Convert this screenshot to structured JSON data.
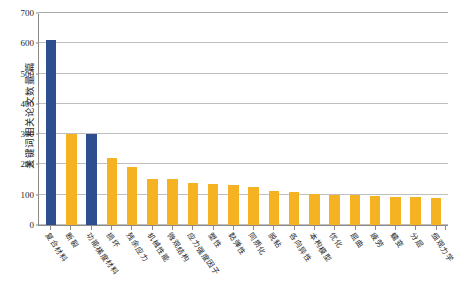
{
  "chart_data": {
    "type": "bar",
    "title": "",
    "xlabel": "",
    "ylabel": "关键词相关论文数量/篇",
    "ylim": [
      0,
      700
    ],
    "ytick_step": 100,
    "yticks": [
      0,
      100,
      200,
      300,
      400,
      500,
      600,
      700
    ],
    "grid": true,
    "legend": "none",
    "categories": [
      "复合材料",
      "断裂",
      "功能梯度材料",
      "损坏",
      "残余应力",
      "机械性能",
      "微观结构",
      "应力强度因子",
      "塑性",
      "黏弹性",
      "同质化",
      "脱粘",
      "各向异性",
      "本构模型",
      "优化",
      "屈曲",
      "疲劳",
      "蠕变",
      "分层",
      "细观力学"
    ],
    "values": [
      610,
      300,
      300,
      222,
      190,
      152,
      152,
      140,
      135,
      132,
      125,
      112,
      108,
      103,
      100,
      98,
      95,
      93,
      92,
      90
    ],
    "colors": [
      "#2e4f8f",
      "#f5b324",
      "#2e4f8f",
      "#f5b324",
      "#f5b324",
      "#f5b324",
      "#f5b324",
      "#f5b324",
      "#f5b324",
      "#f5b324",
      "#f5b324",
      "#f5b324",
      "#f5b324",
      "#f5b324",
      "#f5b324",
      "#f5b324",
      "#f5b324",
      "#f5b324",
      "#f5b324",
      "#f5b324"
    ],
    "palette": {
      "highlight_blue": "#2e4f8f",
      "default_orange": "#f5b324",
      "gridline": "#bfbfbf",
      "axis": "#8a8a8a",
      "text": "#1f1f1f"
    }
  }
}
